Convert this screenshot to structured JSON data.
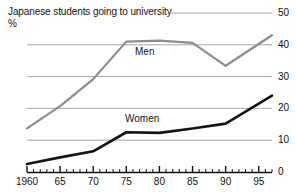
{
  "chart_data": {
    "type": "line",
    "title": "Japanese students going to university",
    "subtitle": "%",
    "xlabel": "",
    "ylabel": "%",
    "ylim": [
      0,
      50
    ],
    "xlim": [
      1960,
      1997
    ],
    "grid": true,
    "legend_position": "inline-labels",
    "y_ticks": [
      {
        "value": 50,
        "label": "50"
      },
      {
        "value": 40,
        "label": "40"
      },
      {
        "value": 30,
        "label": "30"
      },
      {
        "value": 20,
        "label": "20"
      },
      {
        "value": 10,
        "label": "10"
      },
      {
        "value": 0,
        "label": "0"
      }
    ],
    "x_ticks": [
      {
        "value": 1960,
        "label": "1960"
      },
      {
        "value": 1965,
        "label": "65"
      },
      {
        "value": 1970,
        "label": "70"
      },
      {
        "value": 1975,
        "label": "75"
      },
      {
        "value": 1980,
        "label": "80"
      },
      {
        "value": 1985,
        "label": "85"
      },
      {
        "value": 1990,
        "label": "90"
      },
      {
        "value": 1995,
        "label": "95"
      }
    ],
    "x_minor_tick_interval": 1,
    "series": [
      {
        "name": "Men",
        "label": "Men",
        "color": "#8c8c8c",
        "x": [
          1960,
          1965,
          1970,
          1975,
          1980,
          1985,
          1990,
          1997
        ],
        "values": [
          13.7,
          20.7,
          29.2,
          41.0,
          41.3,
          40.6,
          33.4,
          43.0
        ]
      },
      {
        "name": "Women",
        "label": "Women",
        "color": "#141414",
        "x": [
          1960,
          1965,
          1970,
          1975,
          1980,
          1985,
          1990,
          1997
        ],
        "values": [
          2.5,
          4.6,
          6.5,
          12.5,
          12.3,
          13.7,
          15.2,
          24.0
        ]
      }
    ]
  },
  "annotations": {
    "men_label": "Men",
    "women_label": "Women"
  },
  "colors": {
    "men": "#8c8c8c",
    "women": "#141414",
    "grid": "#a6a6a6",
    "axis": "#111111",
    "background": "#ffffff"
  }
}
